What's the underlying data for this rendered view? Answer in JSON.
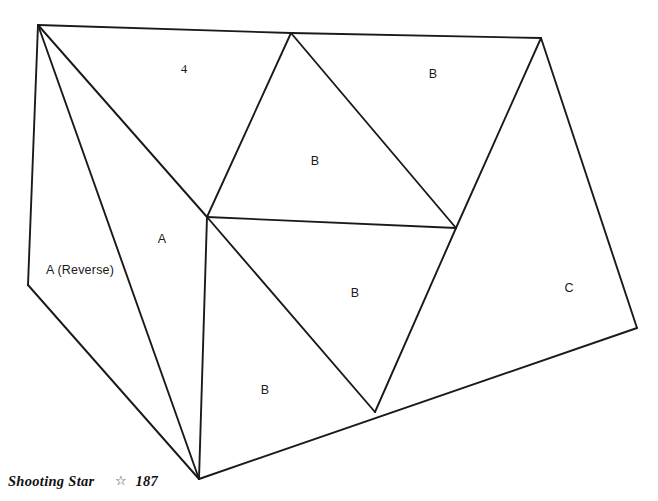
{
  "page": {
    "width": 658,
    "height": 501,
    "background": "#ffffff",
    "line_color": "#1a1a1a"
  },
  "diagram": {
    "name": "Shooting Star pieced block cutting diagram",
    "vertices": {
      "top_left": [
        38,
        25
      ],
      "apex": [
        291,
        33
      ],
      "top_right": [
        541,
        38
      ],
      "left": [
        28,
        285
      ],
      "center": [
        207,
        217
      ],
      "right_mid": [
        456,
        228
      ],
      "right": [
        637,
        328
      ],
      "bottom_mid": [
        375,
        412
      ],
      "bottom": [
        199,
        479
      ]
    },
    "edges": [
      {
        "name": "top-left-to-apex",
        "from": "top_left",
        "to": "apex"
      },
      {
        "name": "apex-to-top-right",
        "from": "apex",
        "to": "top_right"
      },
      {
        "name": "top-left-to-left",
        "from": "top_left",
        "to": "left"
      },
      {
        "name": "left-to-bottom",
        "from": "left",
        "to": "bottom"
      },
      {
        "name": "top-left-to-bottom",
        "from": "top_left",
        "to": "bottom"
      },
      {
        "name": "top-left-to-center",
        "from": "top_left",
        "to": "center"
      },
      {
        "name": "apex-to-center",
        "from": "apex",
        "to": "center"
      },
      {
        "name": "apex-to-right-mid",
        "from": "apex",
        "to": "right_mid"
      },
      {
        "name": "center-to-right-mid",
        "from": "center",
        "to": "right_mid"
      },
      {
        "name": "center-to-bottom",
        "from": "center",
        "to": "bottom"
      },
      {
        "name": "center-to-bottom-mid",
        "from": "center",
        "to": "bottom_mid"
      },
      {
        "name": "right-mid-to-bottom-mid",
        "from": "right_mid",
        "to": "bottom_mid"
      },
      {
        "name": "top-right-to-right-mid",
        "from": "top_right",
        "to": "right_mid"
      },
      {
        "name": "top-right-to-right",
        "from": "top_right",
        "to": "right"
      },
      {
        "name": "right-to-bottom",
        "from": "right",
        "to": "bottom"
      }
    ],
    "labels": [
      {
        "name": "piece-label-4",
        "text": "4",
        "x": 184,
        "y": 68,
        "style": "numeric"
      },
      {
        "name": "piece-label-b-top-right",
        "text": "B",
        "x": 433,
        "y": 74,
        "style": "letter"
      },
      {
        "name": "piece-label-b-upper-middle",
        "text": "B",
        "x": 315,
        "y": 161,
        "style": "letter"
      },
      {
        "name": "piece-label-a",
        "text": "A",
        "x": 162,
        "y": 239,
        "style": "letter"
      },
      {
        "name": "piece-label-a-reverse",
        "text": "A (Reverse)",
        "x": 80,
        "y": 270,
        "style": "letter"
      },
      {
        "name": "piece-label-b-center",
        "text": "B",
        "x": 355,
        "y": 293,
        "style": "letter"
      },
      {
        "name": "piece-label-c",
        "text": "C",
        "x": 569,
        "y": 288,
        "style": "letter"
      },
      {
        "name": "piece-label-b-lower-left",
        "text": "B",
        "x": 265,
        "y": 390,
        "style": "letter"
      }
    ]
  },
  "footer": {
    "book_title": "Shooting Star",
    "star_icon": "star-outline-icon",
    "star_glyph": "☆",
    "page_number": "187"
  }
}
